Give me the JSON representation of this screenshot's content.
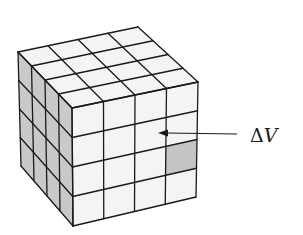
{
  "diagram": {
    "type": "cube-grid",
    "grid_divisions": 4,
    "label": "ΔV",
    "label_meaning": "volume element",
    "highlighted_cell": {
      "face": "front",
      "row": 2,
      "col": 3
    },
    "colors": {
      "face_light": "#f4f4f4",
      "face_side": "#c9c9c9",
      "highlight": "#c4c4c4",
      "line": "#1a1a1a",
      "background": "#ffffff"
    },
    "vertices": {
      "left_back_top": [
        18,
        52
      ],
      "back_top": [
        138,
        27
      ],
      "right_top": [
        198,
        82
      ],
      "front_top": [
        72,
        108
      ],
      "front_bottom": [
        73,
        226
      ],
      "right_bottom": [
        196,
        197
      ],
      "left_bottom": [
        21,
        166
      ]
    },
    "arrow": {
      "from": [
        237,
        134
      ],
      "to": [
        158,
        133
      ]
    }
  }
}
